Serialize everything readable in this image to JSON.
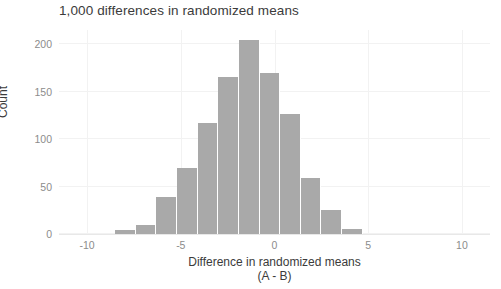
{
  "chart_data": {
    "type": "bar",
    "title": "1,000 differences in randomized means",
    "xlabel": "Difference in randomized means",
    "xlabel_line2": "(A - B)",
    "ylabel": "Count",
    "xlim": [
      -11.5,
      11.5
    ],
    "ylim": [
      0,
      215
    ],
    "grid": true,
    "legend": null,
    "bin_width": 1.1,
    "bar_color": "#a9a9a9",
    "background_color": "#ffffff",
    "gridline_color": "#f2f2f2",
    "axis_text_color": "#8c8c8c",
    "title_text_color": "#3b3b3b",
    "categories": [
      -8.0,
      -6.9,
      -5.8,
      -4.7,
      -3.6,
      -2.5,
      -1.4,
      -0.3,
      0.8,
      1.9,
      3.0,
      4.1,
      5.2,
      6.3
    ],
    "values": [
      4,
      10,
      39,
      70,
      117,
      165,
      205,
      170,
      127,
      59,
      25,
      5,
      0,
      0
    ],
    "bin_edges": [
      -8.5,
      -7.4,
      -6.3,
      -5.2,
      -4.1,
      -3.0,
      -1.9,
      -0.8,
      0.3,
      1.4,
      2.5,
      3.6,
      4.7,
      5.8,
      6.9
    ],
    "total_observations": 1000,
    "y_ticks": [
      0,
      50,
      100,
      150,
      200
    ],
    "y_tick_labels": [
      "0",
      "50",
      "100",
      "150",
      "200"
    ],
    "x_ticks": [
      -10,
      -5,
      0,
      5,
      10
    ],
    "x_tick_labels": [
      "-10",
      "-5",
      "0",
      "5",
      "10"
    ]
  }
}
